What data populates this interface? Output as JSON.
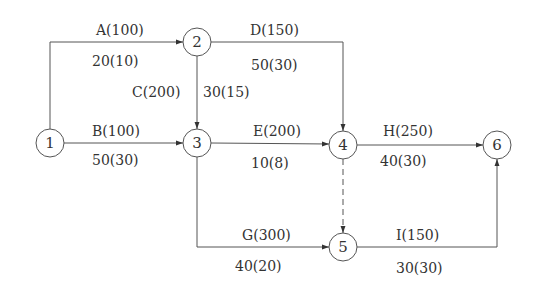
{
  "nodes": [
    {
      "id": "1",
      "label": "1",
      "x": 50,
      "y": 143
    },
    {
      "id": "2",
      "label": "2",
      "x": 197,
      "y": 42
    },
    {
      "id": "3",
      "label": "3",
      "x": 197,
      "y": 143
    },
    {
      "id": "4",
      "label": "4",
      "x": 343,
      "y": 145
    },
    {
      "id": "5",
      "label": "5",
      "x": 343,
      "y": 247
    },
    {
      "id": "6",
      "label": "6",
      "x": 497,
      "y": 145
    }
  ],
  "activities": {
    "A": {
      "name": "A(100)",
      "detail": "20(10)",
      "from": "1",
      "to": "2"
    },
    "B": {
      "name": "B(100)",
      "detail": "50(30)",
      "from": "1",
      "to": "3"
    },
    "C": {
      "name": "C(200)",
      "detail": "30(15)",
      "from": "2",
      "to": "3"
    },
    "D": {
      "name": "D(150)",
      "detail": "50(30)",
      "from": "2",
      "to": "4"
    },
    "E": {
      "name": "E(200)",
      "detail": "10(8)",
      "from": "3",
      "to": "4"
    },
    "G": {
      "name": "G(300)",
      "detail": "40(20)",
      "from": "3",
      "to": "5"
    },
    "H": {
      "name": "H(250)",
      "detail": "40(30)",
      "from": "4",
      "to": "6"
    },
    "I": {
      "name": "I(150)",
      "detail": "30(30)",
      "from": "5",
      "to": "6"
    },
    "dummy": {
      "from": "4",
      "to": "5",
      "style": "dashed"
    }
  },
  "colors": {
    "line": "#555555",
    "text": "#333333",
    "background": "#ffffff"
  }
}
